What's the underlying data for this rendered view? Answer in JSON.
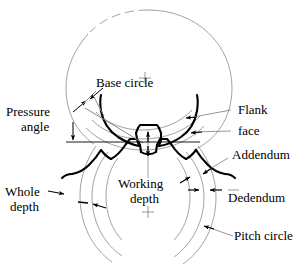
{
  "figure": {
    "type": "engineering-line-drawing",
    "background_color": "#ffffff",
    "ink_color": "#000000",
    "construction_line_color": "#8a8a8a"
  },
  "labels": {
    "base_circle": "Base circle",
    "pressure_angle_line1": "Pressure",
    "pressure_angle_line2": "angle",
    "flank": "Flank",
    "face": "face",
    "addendum": "Addendum",
    "dedendum": "Dedendum",
    "pitch_circle": "Pitch circle",
    "whole_depth_line1": "Whole",
    "whole_depth_line2": "depth",
    "working_depth_line1": "Working",
    "working_depth_line2": "depth"
  },
  "markers": {
    "upper_gear_center": "+",
    "lower_gear_center": "+"
  }
}
